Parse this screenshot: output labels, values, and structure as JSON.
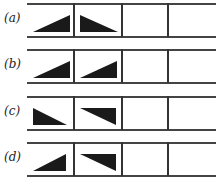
{
  "figure": {
    "rows": [
      {
        "label": "(a)",
        "cells": [
          "up-right",
          "down-right",
          "empty",
          "empty"
        ]
      },
      {
        "label": "(b)",
        "cells": [
          "up-right",
          "up-right",
          "empty",
          "empty"
        ]
      },
      {
        "label": "(c)",
        "cells": [
          "down-right",
          "down-right-flipped",
          "empty",
          "empty"
        ]
      },
      {
        "label": "(d)",
        "cells": [
          "up-right",
          "down-right-flipped",
          "empty",
          "empty"
        ]
      }
    ],
    "colors": {
      "fill": "#1a1a1a",
      "line": "#444444"
    }
  }
}
